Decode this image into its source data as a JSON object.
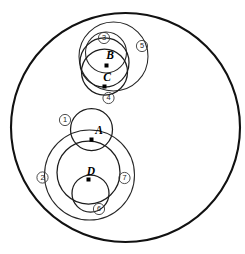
{
  "figure": {
    "background_color": "#ffffff",
    "width": 245,
    "height": 254,
    "colors": {
      "outer_stroke": "#111111",
      "solid_stroke": "#1c1c1c",
      "dashed_stroke": "#b5b5b5",
      "dot_fill": "#000000",
      "label_text": "#000000"
    }
  },
  "outer_circle": {
    "name": "outer-boundary",
    "cx": 125.5,
    "cy": 127.5,
    "r": 114.5
  },
  "limit_point": {
    "x": 228,
    "y": 127.5
  },
  "point_labels": [
    {
      "id": "A",
      "text": "A",
      "x": 99,
      "y": 131,
      "dot_x": 91.5,
      "dot_y": 139.5
    },
    {
      "id": "B",
      "text": "B",
      "x": 110,
      "y": 56,
      "dot_x": 106.5,
      "dot_y": 65.5
    },
    {
      "id": "C",
      "text": "C",
      "x": 107,
      "y": 78,
      "dot_x": 104.5,
      "dot_y": 86.5
    },
    {
      "id": "D",
      "text": "D",
      "x": 91,
      "y": 172,
      "dot_x": 88.5,
      "dot_y": 179.5
    }
  ],
  "numbered_labels": [
    {
      "id": "1",
      "text": "1",
      "x": 65,
      "y": 120,
      "r": 5.6
    },
    {
      "id": "2",
      "text": "2",
      "x": 42.5,
      "y": 177.5,
      "r": 5.6
    },
    {
      "id": "3",
      "text": "3",
      "x": 104,
      "y": 38,
      "r": 5.6
    },
    {
      "id": "4",
      "text": "4",
      "x": 108.5,
      "y": 98,
      "r": 5.6
    },
    {
      "id": "5",
      "text": "5",
      "x": 142,
      "y": 46,
      "r": 5.6
    },
    {
      "id": "6",
      "text": "6",
      "x": 99,
      "y": 209,
      "r": 5.6
    },
    {
      "id": "7",
      "text": "7",
      "x": 124.5,
      "y": 178,
      "r": 5.6
    }
  ],
  "solid_circles": [
    {
      "id": "circle-3",
      "label": "3",
      "cx": 106,
      "cy": 52.5,
      "r": 20.5,
      "weight": "thin"
    },
    {
      "id": "circle-B",
      "label": "B",
      "cx": 104.5,
      "cy": 62.5,
      "r": 24.5,
      "weight": "normal"
    },
    {
      "id": "circle-C",
      "label": "C",
      "cx": 104.5,
      "cy": 72.0,
      "r": 23.0,
      "weight": "normal"
    },
    {
      "id": "circle-5",
      "label": "5",
      "cx": 113.5,
      "cy": 56.5,
      "r": 34.5,
      "weight": "thin"
    },
    {
      "id": "circle-A",
      "label": "A",
      "cx": 91.5,
      "cy": 129.5,
      "r": 21.0,
      "weight": "normal"
    },
    {
      "id": "circle-7",
      "label": "7",
      "cx": 89.5,
      "cy": 175.0,
      "r": 45.0,
      "weight": "thin"
    },
    {
      "id": "circle-D",
      "label": "D",
      "cx": 88.5,
      "cy": 172.5,
      "r": 31.5,
      "weight": "normal"
    },
    {
      "id": "circle-6",
      "label": "6",
      "cx": 90.5,
      "cy": 193.5,
      "r": 18.5,
      "weight": "normal"
    }
  ],
  "dashed_family_through_limit": {
    "description": "Coaxial arcs converging toward the right limit point",
    "count": 14
  },
  "dashed_orthogonal_circles": {
    "description": "Dashed circles orthogonal to the arc family",
    "count": 4
  }
}
